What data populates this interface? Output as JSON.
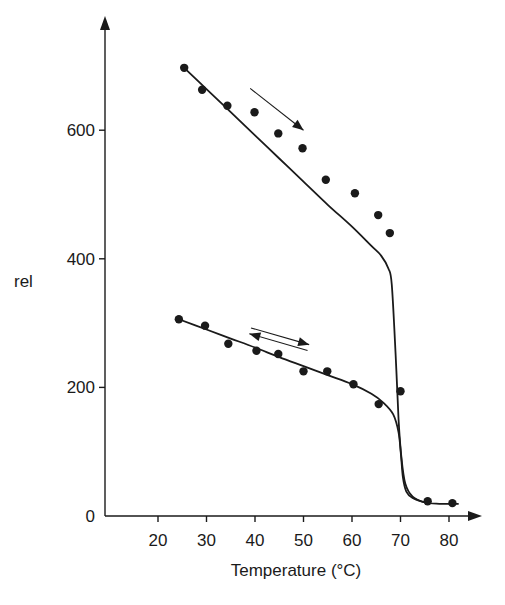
{
  "chart_data": {
    "type": "scatter",
    "title": "",
    "xlabel": "Temperature (°C)",
    "ylabel": "rel",
    "xlim": [
      10,
      84
    ],
    "ylim": [
      0,
      680
    ],
    "x_ticks": [
      20,
      30,
      40,
      50,
      60,
      70,
      80
    ],
    "y_ticks": [
      0,
      200,
      400,
      600
    ],
    "grid": false,
    "legend": null,
    "series": [
      {
        "name": "heating (first scan)",
        "marker": "filled-circle",
        "points": [
          {
            "x": 25.4,
            "y": 697
          },
          {
            "x": 29.1,
            "y": 663
          },
          {
            "x": 34.3,
            "y": 638
          },
          {
            "x": 39.9,
            "y": 628
          },
          {
            "x": 44.8,
            "y": 595
          },
          {
            "x": 49.8,
            "y": 572
          },
          {
            "x": 54.6,
            "y": 523
          },
          {
            "x": 60.6,
            "y": 502
          },
          {
            "x": 65.4,
            "y": 468
          },
          {
            "x": 67.8,
            "y": 440
          },
          {
            "x": 70.0,
            "y": 194
          },
          {
            "x": 75.6,
            "y": 23
          },
          {
            "x": 80.7,
            "y": 20
          }
        ],
        "fit_curve": [
          [
            25.4,
            697
          ],
          [
            30,
            664
          ],
          [
            35,
            628
          ],
          [
            40,
            592
          ],
          [
            45,
            556
          ],
          [
            50,
            520
          ],
          [
            55,
            484
          ],
          [
            60,
            450
          ],
          [
            64,
            420
          ],
          [
            66,
            405
          ],
          [
            67.5,
            385
          ],
          [
            68.2,
            360
          ],
          [
            69.0,
            250
          ],
          [
            69.6,
            150
          ],
          [
            70.2,
            90
          ],
          [
            71.0,
            50
          ],
          [
            72.5,
            30
          ],
          [
            75,
            21
          ],
          [
            78,
            19
          ],
          [
            82,
            19
          ]
        ],
        "annotation": {
          "type": "arrow",
          "direction": "right-down",
          "meaning": "heating"
        }
      },
      {
        "name": "reversible (cooling/reheating)",
        "marker": "filled-circle",
        "points": [
          {
            "x": 24.3,
            "y": 306
          },
          {
            "x": 29.7,
            "y": 296
          },
          {
            "x": 34.5,
            "y": 268
          },
          {
            "x": 40.3,
            "y": 257
          },
          {
            "x": 44.8,
            "y": 252
          },
          {
            "x": 50.0,
            "y": 225
          },
          {
            "x": 54.9,
            "y": 225
          },
          {
            "x": 60.3,
            "y": 205
          },
          {
            "x": 65.5,
            "y": 174
          }
        ],
        "fit_curve": [
          [
            24.3,
            306
          ],
          [
            30,
            290
          ],
          [
            35,
            276
          ],
          [
            40,
            262
          ],
          [
            45,
            247
          ],
          [
            50,
            233
          ],
          [
            55,
            219
          ],
          [
            60,
            205
          ],
          [
            64,
            190
          ],
          [
            66.5,
            176
          ],
          [
            68.5,
            158
          ],
          [
            69.6,
            130
          ],
          [
            70.1,
            95
          ],
          [
            70.5,
            60
          ],
          [
            71.2,
            38
          ],
          [
            72.5,
            28
          ],
          [
            75,
            21
          ]
        ],
        "annotation": {
          "type": "double-arrow",
          "direction": "bidirectional",
          "meaning": "reversible"
        }
      }
    ],
    "annotations": [
      {
        "type": "arrow",
        "from": [
          39,
          665
        ],
        "to": [
          50,
          600
        ],
        "label": ""
      },
      {
        "type": "double-arrow",
        "from": [
          39,
          288
        ],
        "to": [
          51,
          262
        ],
        "label": ""
      }
    ]
  },
  "axes": {
    "x_title": "Temperature (°C)",
    "y_title": "rel",
    "x_tick_labels": [
      "20",
      "30",
      "40",
      "50",
      "60",
      "70",
      "80"
    ],
    "y_tick_labels": [
      "0",
      "200",
      "400",
      "600"
    ]
  }
}
